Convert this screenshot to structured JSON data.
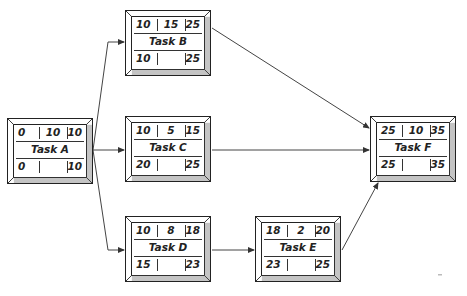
{
  "diagram": {
    "type": "activity-on-node network",
    "tasks": [
      {
        "id": "A",
        "name": "Task A",
        "es": "0",
        "duration": "10",
        "ef": "10",
        "ls": "0",
        "lf": "10",
        "x": 7,
        "y": 118
      },
      {
        "id": "B",
        "name": "Task B",
        "es": "10",
        "duration": "15",
        "ef": "25",
        "ls": "10",
        "lf": "25",
        "x": 125,
        "y": 10
      },
      {
        "id": "C",
        "name": "Task C",
        "es": "10",
        "duration": "5",
        "ef": "15",
        "ls": "20",
        "lf": "25",
        "x": 125,
        "y": 116
      },
      {
        "id": "D",
        "name": "Task D",
        "es": "10",
        "duration": "8",
        "ef": "18",
        "ls": "15",
        "lf": "23",
        "x": 125,
        "y": 216
      },
      {
        "id": "E",
        "name": "Task E",
        "es": "18",
        "duration": "2",
        "ef": "20",
        "ls": "23",
        "lf": "25",
        "x": 255,
        "y": 216
      },
      {
        "id": "F",
        "name": "Task F",
        "es": "25",
        "duration": "10",
        "ef": "35",
        "ls": "25",
        "lf": "35",
        "x": 370,
        "y": 116
      }
    ],
    "edges": [
      {
        "from": "A",
        "to": "B"
      },
      {
        "from": "A",
        "to": "C"
      },
      {
        "from": "A",
        "to": "D"
      },
      {
        "from": "B",
        "to": "F"
      },
      {
        "from": "C",
        "to": "F"
      },
      {
        "from": "D",
        "to": "E"
      },
      {
        "from": "E",
        "to": "F"
      }
    ]
  }
}
